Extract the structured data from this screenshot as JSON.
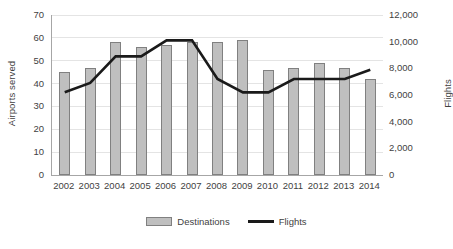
{
  "chart_data": {
    "type": "bar",
    "title": "",
    "xlabel": "",
    "ylabel": "Airports served",
    "y2label": "Flights",
    "categories": [
      "2002",
      "2003",
      "2004",
      "2005",
      "2006",
      "2007",
      "2008",
      "2009",
      "2010",
      "2011",
      "2012",
      "2013",
      "2014"
    ],
    "ylim": [
      0,
      70
    ],
    "y2lim": [
      0,
      12000
    ],
    "yticks": [
      "0",
      "10",
      "20",
      "30",
      "40",
      "50",
      "60",
      "70"
    ],
    "y2ticks": [
      "0",
      "2,000",
      "4,000",
      "6,000",
      "8,000",
      "10,000",
      "12,000"
    ],
    "grid": true,
    "legend_position": "bottom",
    "series": [
      {
        "name": "Destinations",
        "type": "bar",
        "axis": "left",
        "color": "#bfbfbf",
        "border_color": "#808080",
        "values": [
          45,
          47,
          58,
          56,
          57,
          58,
          58,
          59,
          46,
          47,
          49,
          47,
          42
        ]
      },
      {
        "name": "Flights",
        "type": "line",
        "axis": "right",
        "color": "#1a1a1a",
        "values": [
          6200,
          6900,
          8900,
          8900,
          10100,
          10100,
          7200,
          6200,
          6200,
          7200,
          7200,
          7200,
          7900
        ]
      }
    ]
  },
  "legend": {
    "items": [
      {
        "label": "Destinations",
        "swatch": "bar-swatch"
      },
      {
        "label": "Flights",
        "swatch": "line-swatch"
      }
    ]
  }
}
